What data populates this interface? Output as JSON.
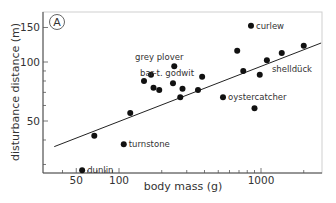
{
  "chart_data": {
    "type": "scatter",
    "title": "",
    "panel_label": "A",
    "xlabel": "body mass (g)",
    "ylabel": "disturbance distance (m)",
    "xscale": "log",
    "yscale": "log",
    "xlim": [
      30,
      3000
    ],
    "ylim": [
      20,
      170
    ],
    "grid": false,
    "legend": null,
    "x_ticks": [
      {
        "value": 50,
        "label": "50"
      },
      {
        "value": 100,
        "label": "100"
      },
      {
        "value": 1000,
        "label": "1000"
      }
    ],
    "x_minor_ticks": [
      40,
      60,
      70,
      80,
      90,
      200,
      300,
      400,
      500,
      600,
      700,
      800,
      900,
      2000
    ],
    "y_ticks": [
      {
        "value": 50,
        "label": "50"
      },
      {
        "value": 100,
        "label": "100"
      },
      {
        "value": 150,
        "label": "150"
      }
    ],
    "y_minor_ticks": [
      30,
      40,
      60,
      70,
      80,
      90
    ],
    "points": [
      {
        "x": 55,
        "y": 28,
        "label": "dunlin"
      },
      {
        "x": 67,
        "y": 42,
        "label": ""
      },
      {
        "x": 108,
        "y": 38,
        "label": "turnstone"
      },
      {
        "x": 120,
        "y": 55,
        "label": ""
      },
      {
        "x": 150,
        "y": 80,
        "label": ""
      },
      {
        "x": 168,
        "y": 86,
        "label": ""
      },
      {
        "x": 175,
        "y": 74,
        "label": ""
      },
      {
        "x": 192,
        "y": 72,
        "label": ""
      },
      {
        "x": 245,
        "y": 95,
        "label": "grey plover"
      },
      {
        "x": 240,
        "y": 78,
        "label": "bar-t. godwit"
      },
      {
        "x": 270,
        "y": 66,
        "label": ""
      },
      {
        "x": 280,
        "y": 73,
        "label": ""
      },
      {
        "x": 360,
        "y": 72,
        "label": ""
      },
      {
        "x": 385,
        "y": 84,
        "label": ""
      },
      {
        "x": 540,
        "y": 66,
        "label": "oystercatcher"
      },
      {
        "x": 680,
        "y": 114,
        "label": ""
      },
      {
        "x": 750,
        "y": 90,
        "label": ""
      },
      {
        "x": 850,
        "y": 153,
        "label": "curlew"
      },
      {
        "x": 900,
        "y": 58,
        "label": ""
      },
      {
        "x": 980,
        "y": 86,
        "label": ""
      },
      {
        "x": 1100,
        "y": 102,
        "label": "shelldück"
      },
      {
        "x": 1400,
        "y": 111,
        "label": ""
      },
      {
        "x": 2000,
        "y": 121,
        "label": ""
      }
    ],
    "fit_line": {
      "type": "linear on log-log",
      "start": {
        "x": 35,
        "y": 37
      },
      "end": {
        "x": 2650,
        "y": 125
      }
    }
  }
}
